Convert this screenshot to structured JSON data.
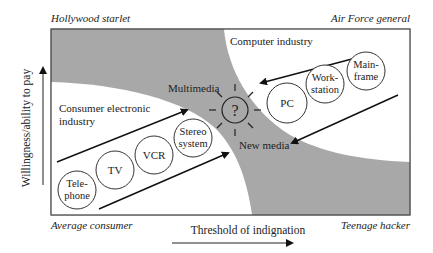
{
  "corners": {
    "top_left": "Hollywood starlet",
    "top_right": "Air Force general",
    "bottom_left": "Average consumer",
    "bottom_right": "Teenage hacker"
  },
  "axes": {
    "y_label": "Willingness/ability to pay",
    "x_label": "Threshold of indignation"
  },
  "regions": {
    "consumer": "Consumer electronic",
    "consumer_line2": "industry",
    "computer": "Computer industry",
    "multimedia": "Multimedia",
    "new_media": "New media"
  },
  "center_symbol": "?",
  "consumer_items": [
    {
      "line1": "Tele-",
      "line2": "phone"
    },
    {
      "line1": "TV",
      "line2": ""
    },
    {
      "line1": "VCR",
      "line2": ""
    },
    {
      "line1": "Stereo",
      "line2": "system"
    }
  ],
  "computer_items": [
    {
      "line1": "PC",
      "line2": ""
    },
    {
      "line1": "Work-",
      "line2": "station"
    },
    {
      "line1": "Main-",
      "line2": "frame"
    }
  ],
  "colors": {
    "shade": "#a8a8a8",
    "ink": "#222222",
    "background": "#ffffff"
  }
}
